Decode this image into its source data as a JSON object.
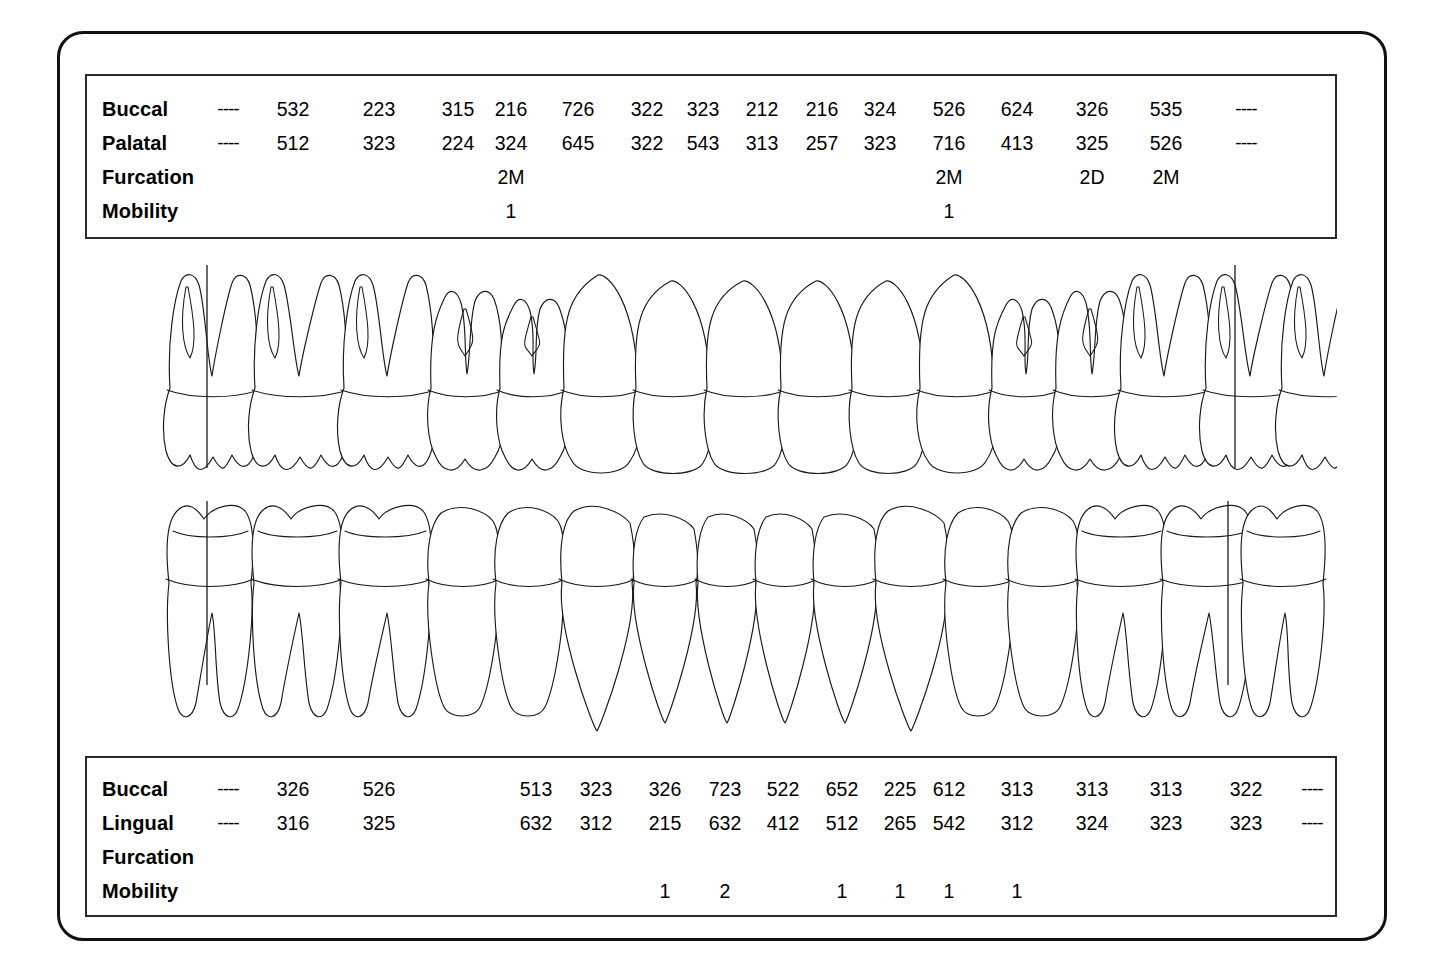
{
  "chart_data": {
    "type": "table",
    "maxillary": {
      "arch_label": "Maxillary",
      "rows": [
        {
          "label": "Buccal",
          "name": "buccal",
          "values": [
            "----",
            "532",
            "223",
            "315",
            "216",
            "726",
            "322",
            "323",
            "212",
            "216",
            "324",
            "526",
            "624",
            "326",
            "535",
            "----"
          ]
        },
        {
          "label": "Palatal",
          "name": "palatal",
          "values": [
            "----",
            "512",
            "323",
            "224",
            "324",
            "645",
            "322",
            "543",
            "313",
            "257",
            "323",
            "716",
            "413",
            "325",
            "526",
            "----"
          ]
        },
        {
          "label": "Furcation",
          "name": "furcation",
          "values": [
            "",
            "",
            "",
            "",
            "2M",
            "",
            "",
            "",
            "",
            "",
            "",
            "2M",
            "",
            "2D",
            "2M",
            ""
          ]
        },
        {
          "label": "Mobility",
          "name": "mobility",
          "values": [
            "",
            "",
            "",
            "",
            "1",
            "",
            "",
            "",
            "",
            "",
            "",
            "1",
            "",
            "",
            "",
            ""
          ]
        }
      ]
    },
    "mandibular": {
      "arch_label": "Mandibular",
      "rows": [
        {
          "label": "Buccal",
          "name": "buccal",
          "values": [
            "----",
            "326",
            "526",
            "",
            "513",
            "323",
            "326",
            "723",
            "522",
            "652",
            "225",
            "612",
            "313",
            "313",
            "313",
            "322",
            "----"
          ]
        },
        {
          "label": "Lingual",
          "name": "lingual",
          "values": [
            "----",
            "316",
            "325",
            "",
            "632",
            "312",
            "215",
            "632",
            "412",
            "512",
            "265",
            "542",
            "312",
            "324",
            "323",
            "323",
            "----"
          ]
        },
        {
          "label": "Furcation",
          "name": "furcation",
          "values": [
            "",
            "",
            "",
            "",
            "",
            "",
            "",
            "",
            "",
            "",
            "",
            "",
            "",
            "",
            "",
            "",
            ""
          ]
        },
        {
          "label": "Mobility",
          "name": "mobility",
          "values": [
            "",
            "",
            "",
            "",
            "",
            "",
            "1",
            "2",
            "",
            "1",
            "1",
            "1",
            "1",
            "",
            "",
            "",
            ""
          ]
        }
      ]
    },
    "column_positions": {
      "maxillary": [
        226,
        291,
        377,
        456,
        509,
        576,
        645,
        701,
        760,
        820,
        878,
        947,
        1015,
        1090,
        1164,
        1244
      ],
      "mandibular": [
        226,
        291,
        377,
        456,
        534,
        594,
        663,
        723,
        781,
        840,
        898,
        947,
        1015,
        1090,
        1164,
        1244,
        1310
      ]
    },
    "diagram": {
      "name": "tooth-diagram",
      "upper_arch_label": "maxillary-teeth",
      "lower_arch_label": "mandibular-teeth",
      "tooth_count_upper": 16,
      "tooth_count_lower": 16,
      "reference_lines": 4
    },
    "colors": {
      "ink": "#1a1a1a",
      "frame": "#111111",
      "table_border": "#2a2a2a",
      "background": "#ffffff"
    }
  }
}
